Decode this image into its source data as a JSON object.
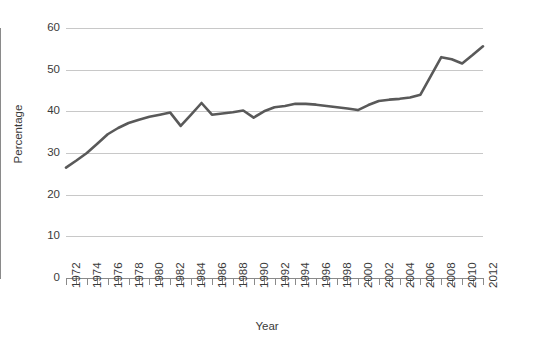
{
  "chart_data": {
    "type": "line",
    "title": "",
    "xlabel": "Year",
    "ylabel": "Percentage",
    "xlim": [
      1972,
      2012
    ],
    "ylim": [
      0,
      60
    ],
    "ytick_step": 10,
    "xtick_step": 1,
    "xlabel_step": 2,
    "grid": true,
    "legend": "none",
    "line_color": "#595959",
    "grid_color": "#c8c8c8",
    "axis_color": "#8a8a8a",
    "x": [
      1972,
      1973,
      1974,
      1975,
      1976,
      1977,
      1978,
      1979,
      1980,
      1981,
      1982,
      1983,
      1984,
      1985,
      1986,
      1987,
      1988,
      1989,
      1990,
      1991,
      1992,
      1993,
      1994,
      1995,
      1996,
      1997,
      1998,
      1999,
      2000,
      2001,
      2002,
      2003,
      2004,
      2005,
      2006,
      2007,
      2008,
      2009,
      2010,
      2011,
      2012
    ],
    "values": [
      26.5,
      28.2,
      30.0,
      32.2,
      34.5,
      36.0,
      37.2,
      38.0,
      38.7,
      39.2,
      39.7,
      36.5,
      39.2,
      42.0,
      39.2,
      39.5,
      39.8,
      40.2,
      38.5,
      40.0,
      41.0,
      41.3,
      41.8,
      41.8,
      41.6,
      41.3,
      41.0,
      40.7,
      40.3,
      41.5,
      42.5,
      42.8,
      43.0,
      43.3,
      44.0,
      48.5,
      53.0,
      52.5,
      51.5,
      53.5,
      55.6
    ],
    "ytick_labels": [
      "0",
      "10",
      "20",
      "30",
      "40",
      "50",
      "60"
    ],
    "xtick_labels": [
      "1972",
      "1974",
      "1976",
      "1978",
      "1980",
      "1982",
      "1984",
      "1986",
      "1988",
      "1990",
      "1992",
      "1994",
      "1996",
      "1998",
      "2000",
      "2002",
      "2004",
      "2006",
      "2008",
      "2010",
      "2012"
    ]
  }
}
